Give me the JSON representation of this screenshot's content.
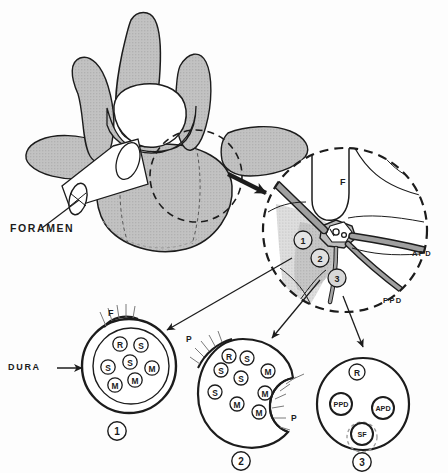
{
  "figure": {
    "colors": {
      "bone_fill": "#b9b9b9",
      "bone_stroke": "#1c1c1c",
      "nerve_fill": "#9a9a9a",
      "soft_tissue_fill": "#d2d2d2",
      "ganglion_fill": "#f2f2f2",
      "ink": "#1c1c1c",
      "background": "#ffffff"
    }
  },
  "vertebra": {
    "name": "vertebra-superior-oblique-view",
    "foramen_label": "FORAMEN"
  },
  "detail_circle": {
    "name": "magnified-foramen-detail",
    "facet_label": "F",
    "ganglion_label": "DRG",
    "apd_label": "APD",
    "ppd_label": "PPD",
    "markers": [
      {
        "id": "1",
        "label": "1"
      },
      {
        "id": "2",
        "label": "2"
      },
      {
        "id": "3",
        "label": "3"
      }
    ]
  },
  "cross_sections": [
    {
      "id": "1",
      "number_label": "1",
      "caption": "DURA",
      "facet_label": "F",
      "pedicle_labels": [],
      "fascicles": [
        {
          "label": "R",
          "cx": 120,
          "cy": 344,
          "r": 7.2
        },
        {
          "label": "S",
          "cx": 141,
          "cy": 345,
          "r": 7.2
        },
        {
          "label": "S",
          "cx": 130,
          "cy": 362,
          "r": 7.2
        },
        {
          "label": "S",
          "cx": 108,
          "cy": 367,
          "r": 7.2
        },
        {
          "label": "M",
          "cx": 152,
          "cy": 368,
          "r": 7.2
        },
        {
          "label": "M",
          "cx": 135,
          "cy": 380,
          "r": 7.2
        },
        {
          "label": "M",
          "cx": 115,
          "cy": 385,
          "r": 7.2
        }
      ]
    },
    {
      "id": "2",
      "number_label": "2",
      "caption": "",
      "facet_label": "",
      "pedicle_labels": [
        "P",
        "P"
      ],
      "fascicles": [
        {
          "label": "R",
          "cx": 229,
          "cy": 356,
          "r": 7.0
        },
        {
          "label": "S",
          "cx": 247,
          "cy": 358,
          "r": 7.0
        },
        {
          "label": "S",
          "cx": 221,
          "cy": 370,
          "r": 7.0
        },
        {
          "label": "S",
          "cx": 241,
          "cy": 378,
          "r": 7.0
        },
        {
          "label": "S",
          "cx": 215,
          "cy": 392,
          "r": 7.0
        },
        {
          "label": "M",
          "cx": 268,
          "cy": 371,
          "r": 7.0
        },
        {
          "label": "M",
          "cx": 265,
          "cy": 393,
          "r": 7.0
        },
        {
          "label": "M",
          "cx": 237,
          "cy": 404,
          "r": 7.0
        },
        {
          "label": "M",
          "cx": 259,
          "cy": 412,
          "r": 7.0
        }
      ]
    },
    {
      "id": "3",
      "number_label": "3",
      "caption": "",
      "facet_label": "",
      "pedicle_labels": [],
      "fascicles": [
        {
          "label": "R",
          "cx": 357,
          "cy": 372,
          "r": 8.0
        },
        {
          "label": "PPD",
          "cx": 341,
          "cy": 404,
          "r": 11.0
        },
        {
          "label": "APD",
          "cx": 383,
          "cy": 408,
          "r": 11.0
        },
        {
          "label": "SF",
          "cx": 362,
          "cy": 434,
          "r": 11.0
        }
      ]
    }
  ]
}
